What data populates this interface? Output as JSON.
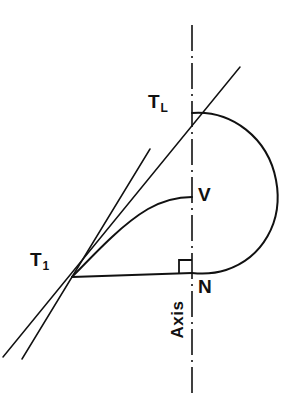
{
  "figure": {
    "type": "geometric-construction-diagram",
    "background_color": "#ffffff",
    "stroke_color": "#111111",
    "labels": {
      "tangent_long_base": "T",
      "tangent_long_sub": "L",
      "tangent_first_base": "T",
      "tangent_first_sub": "1",
      "vertex": "V",
      "normal_point": "N",
      "axis": "Axis"
    },
    "points": {
      "TL": {
        "x": 192,
        "y": 113
      },
      "T1": {
        "x": 72,
        "y": 277
      },
      "V": {
        "x": 192,
        "y": 198
      },
      "N": {
        "x": 192,
        "y": 273
      }
    },
    "axis_line": {
      "x": 192,
      "y_top": 25,
      "y_bottom": 396,
      "style": "dash-dot"
    },
    "right_angle_marker": {
      "at": "N",
      "size": 13
    },
    "elements": [
      "outer-arc",
      "inner-curve",
      "chord-t1-n",
      "tangent-line-long",
      "tangent-line-short",
      "axis-center-line",
      "right-angle-marker"
    ]
  }
}
